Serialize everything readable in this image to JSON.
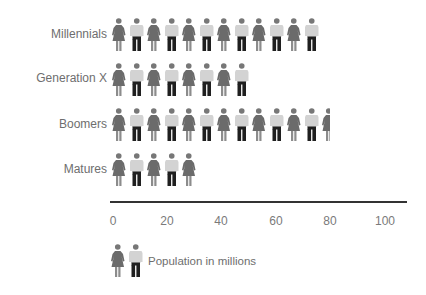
{
  "chart_data": {
    "type": "bar",
    "subtype": "pictogram",
    "title": "",
    "categories": [
      "Millennials",
      "Generation X",
      "Boomers",
      "Matures"
    ],
    "values": [
      75,
      50,
      80,
      32
    ],
    "figures_per_row": [
      12,
      8,
      12.5,
      5
    ],
    "xlabel": "",
    "ylabel": "",
    "xlim": [
      0,
      100
    ],
    "x_ticks": [
      "0",
      "20",
      "40",
      "60",
      "80",
      "100"
    ],
    "legend": [
      {
        "label": "Population in millions",
        "icon": "woman-and-man-pair-icon"
      }
    ],
    "legend_position": "bottom-left",
    "grid": false
  },
  "rows": [
    {
      "label": "Millennials",
      "figures": 12
    },
    {
      "label": "Generation X",
      "figures": 8
    },
    {
      "label": "Boomers",
      "figures": 13,
      "last_partial": true
    },
    {
      "label": "Matures",
      "figures": 5
    }
  ],
  "axis": {
    "ticks": [
      "0",
      "20",
      "40",
      "60",
      "80",
      "100"
    ]
  },
  "legend": {
    "label": "Population in millions"
  },
  "colors": {
    "woman_dress": "#6b6b6b",
    "woman_legs": "#8c8c8c",
    "man_shirt": "#d3d3d3",
    "man_trousers": "#1f1f1f",
    "head": "#777777",
    "axis": "#333333"
  }
}
